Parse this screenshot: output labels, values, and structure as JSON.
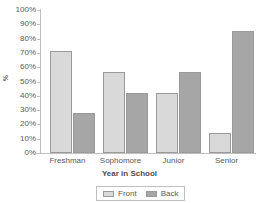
{
  "chart_data": {
    "type": "bar",
    "title": "",
    "xlabel": "Year in School",
    "ylabel": "%",
    "categories": [
      "Freshman",
      "Sophomore",
      "Junior",
      "Senior"
    ],
    "series": [
      {
        "name": "Front",
        "values": [
          71,
          57,
          42,
          14
        ],
        "color": "#D9D9D9"
      },
      {
        "name": "Back",
        "values": [
          28,
          42,
          57,
          85
        ],
        "color": "#A6A6A6"
      }
    ],
    "ylim": [
      0,
      100
    ],
    "ytick_step": 10,
    "ytick_labels": [
      "0%",
      "10%",
      "20%",
      "30%",
      "40%",
      "50%",
      "60%",
      "70%",
      "80%",
      "90%",
      "100%"
    ],
    "grid": false,
    "legend_position": "bottom"
  },
  "axis": {
    "y_title": "%",
    "x_title": "Year in School"
  },
  "legend": {
    "entries": [
      {
        "label": "Front"
      },
      {
        "label": "Back"
      }
    ]
  },
  "colors": {
    "front": "#D9D9D9",
    "back": "#A6A6A6",
    "bar_border": "#9A9A9A",
    "axis": "#BFBFBF",
    "text": "#595959",
    "background": "#FFFFFF"
  }
}
